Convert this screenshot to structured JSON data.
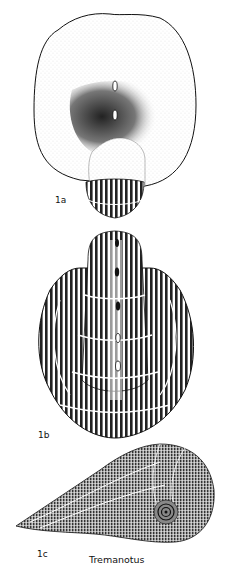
{
  "plate": {
    "genus": "Tremanotus",
    "figures": [
      {
        "label": "1a",
        "view": "apertural view with broad flared aperture and slit tremata"
      },
      {
        "label": "1b",
        "view": "dorsal view showing ribbed shell with row of tremata"
      },
      {
        "label": "1c",
        "view": "lateral view showing coiled spire and extended lip"
      }
    ]
  },
  "colors": {
    "ink": "#111111",
    "paper": "#ffffff"
  }
}
